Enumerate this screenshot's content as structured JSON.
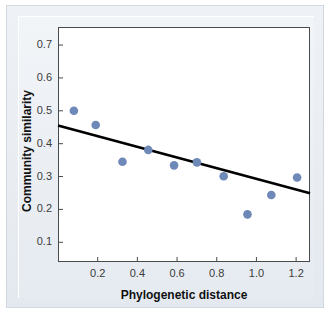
{
  "chart_data": {
    "type": "scatter",
    "title": "",
    "xlabel": "Phylogenetic distance",
    "ylabel": "Community similarity",
    "xlim": [
      0.0,
      1.27
    ],
    "ylim": [
      0.04,
      0.755
    ],
    "xticks": [
      "0.2",
      "0.4",
      "0.6",
      "0.8",
      "1.0",
      "1.2"
    ],
    "xtick_values": [
      0.2,
      0.4,
      0.6,
      0.8,
      1.0,
      1.2
    ],
    "yticks": [
      "0.1",
      "0.2",
      "0.3",
      "0.4",
      "0.5",
      "0.6",
      "0.7"
    ],
    "ytick_values": [
      0.1,
      0.2,
      0.3,
      0.4,
      0.5,
      0.6,
      0.7
    ],
    "grid": false,
    "legend": "none",
    "marker_color": "#6E88B8",
    "line_color": "#000000",
    "points": [
      {
        "x": 0.08,
        "y": 0.5
      },
      {
        "x": 0.19,
        "y": 0.457
      },
      {
        "x": 0.325,
        "y": 0.345
      },
      {
        "x": 0.455,
        "y": 0.381
      },
      {
        "x": 0.585,
        "y": 0.334
      },
      {
        "x": 0.7,
        "y": 0.343
      },
      {
        "x": 0.835,
        "y": 0.301
      },
      {
        "x": 0.955,
        "y": 0.185
      },
      {
        "x": 1.075,
        "y": 0.244
      },
      {
        "x": 1.205,
        "y": 0.297
      }
    ],
    "series": [
      {
        "name": "trend-line",
        "type": "line",
        "x": [
          0.0,
          1.27
        ],
        "values": [
          0.455,
          0.249
        ]
      }
    ]
  }
}
